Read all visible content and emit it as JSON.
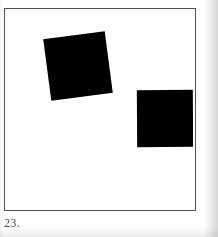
{
  "plate": {
    "caption": "23.",
    "background_color": "#ffffff",
    "frame_color": "#50505a",
    "ink_color": "#000000",
    "width": 218,
    "height": 237
  },
  "frame": {
    "x": 4,
    "y": 8,
    "width": 192,
    "height": 203,
    "stroke_width": 1
  },
  "shapes": [
    {
      "name": "rotated-square",
      "fill": "#000000",
      "x": 42,
      "y": 26,
      "width": 62,
      "height": 62,
      "rotation_deg": -7.5
    },
    {
      "name": "upright-square",
      "fill": "#000000",
      "x": 132,
      "y": 81,
      "width": 56,
      "height": 57,
      "rotation_deg": -0.4
    }
  ]
}
